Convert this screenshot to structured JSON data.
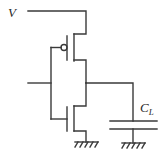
{
  "diagram": {
    "type": "CMOS inverter circuit with load capacitor",
    "labels": {
      "supply": "V",
      "capacitor_main": "C",
      "capacitor_sub": "L"
    },
    "components": [
      {
        "name": "PMOS transistor",
        "position": "top"
      },
      {
        "name": "NMOS transistor",
        "position": "bottom"
      },
      {
        "name": "Load capacitor",
        "label": "C_L"
      },
      {
        "name": "Ground",
        "count": 2
      }
    ],
    "colors": {
      "stroke": "#3a3a3a",
      "background": "#ffffff"
    }
  }
}
